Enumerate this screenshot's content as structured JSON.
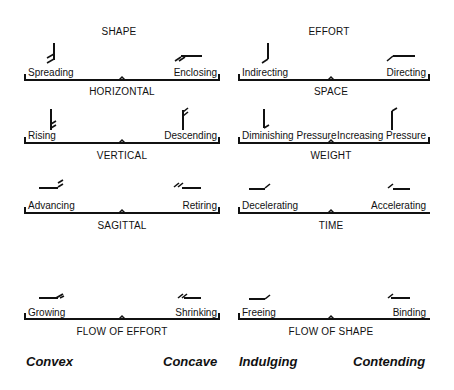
{
  "columns": [
    {
      "title": "SHAPE",
      "rows": [
        {
          "axis": "HORIZONTAL",
          "left": "Spreading",
          "right": "Enclosing",
          "left_glyph": "spreading-glyph",
          "right_glyph": "enclosing-glyph"
        },
        {
          "axis": "VERTICAL",
          "left": "Rising",
          "right": "Descending",
          "left_glyph": "rising-glyph",
          "right_glyph": "descending-glyph"
        },
        {
          "axis": "SAGITTAL",
          "left": "Advancing",
          "right": "Retiring",
          "left_glyph": "advancing-glyph",
          "right_glyph": "retiring-glyph"
        },
        {
          "axis": "FLOW OF EFFORT",
          "left": "Growing",
          "right": "Shrinking",
          "left_glyph": "growing-glyph",
          "right_glyph": "shrinking-glyph"
        }
      ],
      "footer_left": "Convex",
      "footer_right": "Concave"
    },
    {
      "title": "EFFORT",
      "rows": [
        {
          "axis": "SPACE",
          "left": "Indirecting",
          "right": "Directing",
          "left_glyph": "indirecting-glyph",
          "right_glyph": "directing-glyph"
        },
        {
          "axis": "WEIGHT",
          "left": "Diminishing Pressure",
          "right": "Increasing Pressure",
          "left_glyph": "diminishing-pressure-glyph",
          "right_glyph": "increasing-pressure-glyph"
        },
        {
          "axis": "TIME",
          "left": "Decelerating",
          "right": "Accelerating",
          "left_glyph": "decelerating-glyph",
          "right_glyph": "accelerating-glyph"
        },
        {
          "axis": "FLOW OF SHAPE",
          "left": "Freeing",
          "right": "Binding",
          "left_glyph": "freeing-glyph",
          "right_glyph": "binding-glyph"
        }
      ],
      "footer_left": "Indulging",
      "footer_right": "Contending"
    }
  ]
}
